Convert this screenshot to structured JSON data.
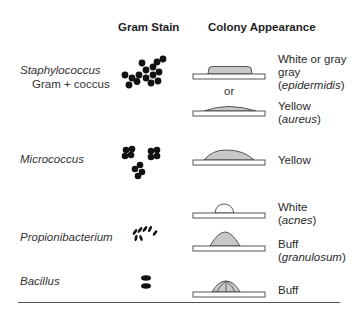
{
  "headers": {
    "gram_stain": "Gram Stain",
    "colony_appearance": "Colony Appearance"
  },
  "rows": [
    {
      "organism": "Staphylococcus",
      "subtitle": "Gram + coccus",
      "gram_stain_icon": "cocci-cluster-icon",
      "colonies": [
        {
          "shape": "flat-raised",
          "fill": "gray",
          "description_plain": "White or gray",
          "description_species": "epidermidis"
        },
        {
          "shape": "convex-low",
          "fill": "gray",
          "description_plain": "Yellow",
          "description_species": "aureus"
        }
      ],
      "separator": "or"
    },
    {
      "organism": "Micrococcus",
      "gram_stain_icon": "cocci-tetrads-icon",
      "colonies": [
        {
          "shape": "convex",
          "fill": "gray",
          "description_plain": "Yellow"
        }
      ]
    },
    {
      "organism": "Propionibacterium",
      "gram_stain_icon": "short-rods-icon",
      "colonies": [
        {
          "shape": "dome-small",
          "fill": "white",
          "description_plain": "White",
          "description_species": "acnes"
        },
        {
          "shape": "umbonate",
          "fill": "gray",
          "description_plain": "Buff",
          "description_species": "granulosum"
        }
      ]
    },
    {
      "organism": "Bacillus",
      "gram_stain_icon": "bacilli-pair-icon",
      "colonies": [
        {
          "shape": "dome-segmented",
          "fill": "gray",
          "description_plain": "Buff"
        }
      ]
    }
  ],
  "colors": {
    "colony_fill": "#c8c8c8",
    "outline": "#444444",
    "stain": "#111111"
  }
}
